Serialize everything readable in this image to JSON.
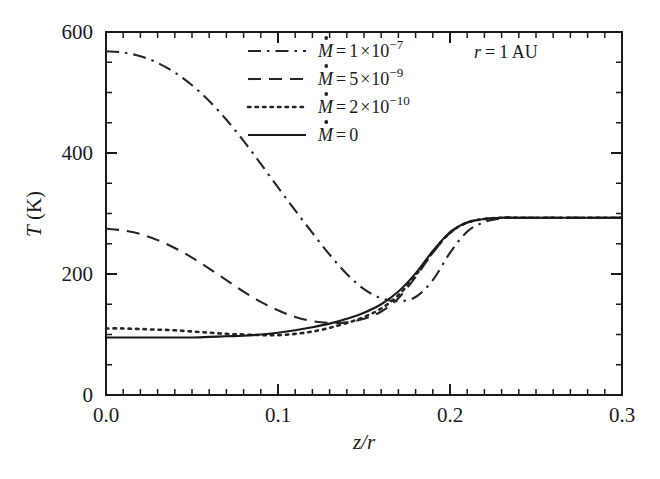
{
  "chart_data": {
    "type": "line",
    "title": "",
    "xlabel": "z/r",
    "ylabel": "T (K)",
    "xlim": [
      0.0,
      0.3
    ],
    "ylim": [
      0,
      600
    ],
    "xticks": [
      0.0,
      0.1,
      0.2,
      0.3
    ],
    "xtick_labels": [
      "0.0",
      "0.1",
      "0.2",
      "0.3"
    ],
    "yticks": [
      0,
      200,
      400,
      600
    ],
    "ytick_labels": [
      "0",
      "200",
      "400",
      "600"
    ],
    "x_minor_step": 0.01,
    "y_minor_step": 50,
    "grid": false,
    "legend_position": "upper-center",
    "annotation": "r = 1 AU",
    "annotation_parts": {
      "var": "r",
      "eq": "=",
      "value": "1 AU"
    },
    "series": [
      {
        "name": "Mdot = 1 x 10^-7",
        "label_var": "M",
        "label_eq": "=",
        "label_mantissa": "1",
        "label_times": "×",
        "label_base": "10",
        "label_exponent": "−7",
        "linestyle": "dashdot",
        "color": "#262626",
        "x": [
          0.0,
          0.01,
          0.02,
          0.03,
          0.04,
          0.05,
          0.06,
          0.07,
          0.08,
          0.09,
          0.1,
          0.11,
          0.12,
          0.13,
          0.14,
          0.15,
          0.16,
          0.17,
          0.18,
          0.19,
          0.2,
          0.21,
          0.22,
          0.23,
          0.24,
          0.25,
          0.26,
          0.27,
          0.28,
          0.29,
          0.3
        ],
        "y": [
          568,
          566,
          560,
          549,
          533,
          512,
          486,
          455,
          420,
          382,
          343,
          305,
          268,
          232,
          200,
          175,
          160,
          155,
          162,
          190,
          235,
          270,
          286,
          292,
          293,
          293,
          293,
          293,
          293,
          293,
          293
        ]
      },
      {
        "name": "Mdot = 5 x 10^-9",
        "label_var": "M",
        "label_eq": "=",
        "label_mantissa": "5",
        "label_times": "×",
        "label_base": "10",
        "label_exponent": "−9",
        "linestyle": "dashed",
        "color": "#262626",
        "x": [
          0.0,
          0.01,
          0.02,
          0.03,
          0.04,
          0.05,
          0.06,
          0.07,
          0.08,
          0.09,
          0.1,
          0.11,
          0.12,
          0.13,
          0.14,
          0.15,
          0.16,
          0.17,
          0.18,
          0.19,
          0.2,
          0.21,
          0.22,
          0.23,
          0.24,
          0.25,
          0.26,
          0.27,
          0.28,
          0.29,
          0.3
        ],
        "y": [
          275,
          272,
          266,
          256,
          243,
          227,
          209,
          190,
          171,
          154,
          140,
          129,
          122,
          119,
          120,
          126,
          138,
          160,
          195,
          235,
          268,
          285,
          291,
          293,
          293,
          293,
          293,
          293,
          293,
          293,
          293
        ]
      },
      {
        "name": "Mdot = 2 x 10^-10",
        "label_var": "M",
        "label_eq": "=",
        "label_mantissa": "2",
        "label_times": "×",
        "label_base": "10",
        "label_exponent": "−10",
        "linestyle": "dotted",
        "color": "#262626",
        "x": [
          0.0,
          0.01,
          0.02,
          0.03,
          0.04,
          0.05,
          0.06,
          0.07,
          0.08,
          0.09,
          0.1,
          0.11,
          0.12,
          0.13,
          0.14,
          0.15,
          0.16,
          0.17,
          0.18,
          0.19,
          0.2,
          0.21,
          0.22,
          0.23,
          0.24,
          0.25,
          0.26,
          0.27,
          0.28,
          0.29,
          0.3
        ],
        "y": [
          110,
          110,
          109,
          108,
          107,
          105,
          103,
          101,
          100,
          99,
          99,
          101,
          105,
          111,
          119,
          129,
          143,
          165,
          198,
          236,
          268,
          285,
          291,
          293,
          293,
          293,
          293,
          293,
          293,
          293,
          293
        ]
      },
      {
        "name": "Mdot = 0",
        "label_var": "M",
        "label_eq": "=",
        "label_mantissa": "0",
        "label_times": "",
        "label_base": "",
        "label_exponent": "",
        "linestyle": "solid",
        "color": "#1a1a1a",
        "x": [
          0.0,
          0.01,
          0.02,
          0.03,
          0.04,
          0.05,
          0.06,
          0.07,
          0.08,
          0.09,
          0.1,
          0.11,
          0.12,
          0.13,
          0.14,
          0.15,
          0.16,
          0.17,
          0.18,
          0.19,
          0.2,
          0.21,
          0.22,
          0.23,
          0.24,
          0.25,
          0.26,
          0.27,
          0.28,
          0.29,
          0.3
        ],
        "y": [
          95,
          95,
          95,
          95,
          95,
          95,
          96,
          97,
          98,
          100,
          103,
          107,
          112,
          118,
          126,
          136,
          150,
          171,
          201,
          238,
          269,
          285,
          291,
          293,
          293,
          293,
          293,
          293,
          293,
          293,
          293
        ]
      }
    ]
  }
}
